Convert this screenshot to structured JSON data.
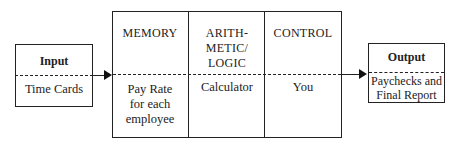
{
  "input": {
    "title": "Input",
    "content": "Time Cards"
  },
  "cpu": {
    "sections": [
      {
        "title": "MEMORY",
        "content_lines": [
          "Pay Rate",
          "for each",
          "employee"
        ]
      },
      {
        "title_lines": [
          "ARITH-",
          "METIC/",
          "LOGIC"
        ],
        "content": "Calculator"
      },
      {
        "title": "CONTROL",
        "content": "You"
      }
    ]
  },
  "output": {
    "title": "Output",
    "content_lines": [
      "Paychecks and",
      "Final Report"
    ]
  },
  "colors": {
    "line": "#222222",
    "background": "#ffffff"
  }
}
